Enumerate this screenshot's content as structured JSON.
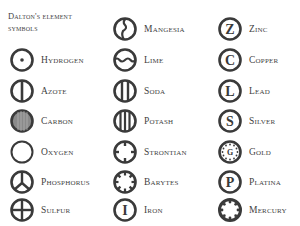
{
  "title": "Dalton's element symbols",
  "colors": {
    "ink": "#3a3a3a",
    "background": "#ffffff",
    "carbon_fill": "#8a8a8a"
  },
  "columns": [
    {
      "elements": [
        {
          "name": "Hydrogen",
          "symbol": "circle-dot"
        },
        {
          "name": "Azote",
          "symbol": "circle-vertical-line"
        },
        {
          "name": "Carbon",
          "symbol": "circle-filled-hatched"
        },
        {
          "name": "Oxygen",
          "symbol": "circle-empty"
        },
        {
          "name": "Phosphorus",
          "symbol": "circle-peace"
        },
        {
          "name": "Sulfur",
          "symbol": "circle-cross"
        }
      ]
    },
    {
      "elements": [
        {
          "name": "Mangesia",
          "symbol": "circle-zigzag"
        },
        {
          "name": "Lime",
          "symbol": "circle-wave"
        },
        {
          "name": "Soda",
          "symbol": "circle-two-lines"
        },
        {
          "name": "Potash",
          "symbol": "circle-three-lines"
        },
        {
          "name": "Strontian",
          "symbol": "circle-four-ticks"
        },
        {
          "name": "Barytes",
          "symbol": "circle-eight-ticks"
        },
        {
          "name": "Iron",
          "symbol": "circle-letter-I"
        }
      ]
    },
    {
      "elements": [
        {
          "name": "Zinc",
          "symbol": "circle-letter-Z",
          "letter": "Z"
        },
        {
          "name": "Copper",
          "symbol": "circle-letter-C",
          "letter": "C"
        },
        {
          "name": "Lead",
          "symbol": "circle-letter-L",
          "letter": "L"
        },
        {
          "name": "Silver",
          "symbol": "circle-letter-S",
          "letter": "S"
        },
        {
          "name": "Gold",
          "symbol": "circle-dots-G",
          "letter": "G"
        },
        {
          "name": "Platina",
          "symbol": "circle-letter-P",
          "letter": "P"
        },
        {
          "name": "Mercury",
          "symbol": "circle-notched"
        }
      ]
    }
  ]
}
